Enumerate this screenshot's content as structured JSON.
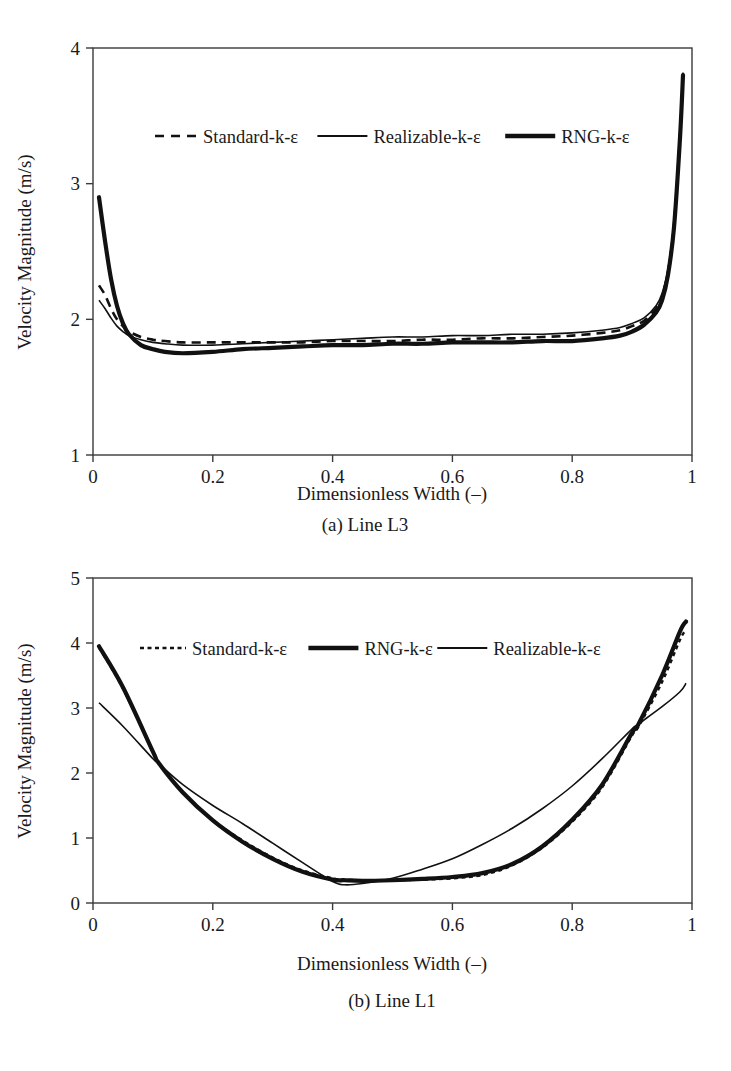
{
  "figure": {
    "panels": [
      {
        "id": "panel-a",
        "caption": "(a) Line L3",
        "xlabel": "Dimensionless Width (–)",
        "ylabel": "Velocity Magnitude (m/s)",
        "xticks": [
          "0",
          "0.2",
          "0.4",
          "0.6",
          "0.8",
          "1"
        ],
        "yticks": [
          "1",
          "2",
          "3",
          "4"
        ],
        "legend": [
          {
            "label": "Standard-k-ε",
            "style": "dashed"
          },
          {
            "label": "Realizable-k-ε",
            "style": "thin-solid"
          },
          {
            "label": "RNG-k-ε",
            "style": "thick-solid"
          }
        ]
      },
      {
        "id": "panel-b",
        "caption": "(b) Line L1",
        "xlabel": "Dimensionless Width (–)",
        "ylabel": "Velocity Magnitude (m/s)",
        "xticks": [
          "0",
          "0.2",
          "0.4",
          "0.6",
          "0.8",
          "1"
        ],
        "yticks": [
          "0",
          "1",
          "2",
          "3",
          "4",
          "5"
        ],
        "legend": [
          {
            "label": "Standard-k-ε",
            "style": "dotted"
          },
          {
            "label": "RNG-k-ε",
            "style": "thick-solid"
          },
          {
            "label": "Realizable-k-ε",
            "style": "thin-solid"
          }
        ]
      }
    ]
  },
  "chart_data": [
    {
      "type": "line",
      "title": "(a) Line L3",
      "xlabel": "Dimensionless Width (–)",
      "ylabel": "Velocity Magnitude (m/s)",
      "xlim": [
        0,
        1
      ],
      "ylim": [
        1,
        4
      ],
      "grid": false,
      "legend_position": "upper-center-inside",
      "x": [
        0.01,
        0.02,
        0.03,
        0.04,
        0.05,
        0.06,
        0.08,
        0.1,
        0.12,
        0.15,
        0.2,
        0.25,
        0.3,
        0.35,
        0.4,
        0.45,
        0.5,
        0.55,
        0.6,
        0.65,
        0.7,
        0.75,
        0.8,
        0.85,
        0.88,
        0.9,
        0.92,
        0.94,
        0.95,
        0.96,
        0.97,
        0.98,
        0.985
      ],
      "series": [
        {
          "name": "Standard-k-ε",
          "style": "dashed",
          "values": [
            2.25,
            2.18,
            2.08,
            2.0,
            1.95,
            1.91,
            1.87,
            1.85,
            1.84,
            1.83,
            1.83,
            1.83,
            1.83,
            1.83,
            1.84,
            1.84,
            1.84,
            1.85,
            1.85,
            1.86,
            1.86,
            1.87,
            1.88,
            1.9,
            1.92,
            1.95,
            1.99,
            2.08,
            2.17,
            2.35,
            2.7,
            3.35,
            3.8
          ]
        },
        {
          "name": "Realizable-k-ε",
          "style": "thin-solid",
          "values": [
            2.14,
            2.08,
            2.01,
            1.95,
            1.91,
            1.88,
            1.85,
            1.83,
            1.82,
            1.81,
            1.81,
            1.82,
            1.83,
            1.84,
            1.85,
            1.86,
            1.87,
            1.87,
            1.88,
            1.88,
            1.89,
            1.89,
            1.9,
            1.92,
            1.94,
            1.97,
            2.01,
            2.1,
            2.19,
            2.37,
            2.72,
            3.38,
            3.82
          ]
        },
        {
          "name": "RNG-k-ε",
          "style": "thick-solid",
          "values": [
            2.9,
            2.58,
            2.3,
            2.1,
            1.97,
            1.89,
            1.81,
            1.78,
            1.76,
            1.75,
            1.76,
            1.78,
            1.79,
            1.8,
            1.81,
            1.81,
            1.82,
            1.82,
            1.83,
            1.83,
            1.83,
            1.84,
            1.84,
            1.86,
            1.88,
            1.91,
            1.96,
            2.05,
            2.14,
            2.33,
            2.68,
            3.34,
            3.8
          ]
        }
      ]
    },
    {
      "type": "line",
      "title": "(b) Line L1",
      "xlabel": "Dimensionless Width (–)",
      "ylabel": "Velocity Magnitude (m/s)",
      "xlim": [
        0,
        1
      ],
      "ylim": [
        0,
        5
      ],
      "grid": false,
      "legend_position": "upper-center-inside",
      "x": [
        0.01,
        0.05,
        0.1,
        0.11,
        0.15,
        0.2,
        0.25,
        0.3,
        0.35,
        0.4,
        0.42,
        0.45,
        0.5,
        0.55,
        0.6,
        0.65,
        0.7,
        0.75,
        0.8,
        0.85,
        0.9,
        0.91,
        0.95,
        0.98,
        0.99
      ],
      "series": [
        {
          "name": "Standard-k-ε",
          "style": "dotted",
          "values": [
            3.93,
            3.3,
            2.32,
            2.14,
            1.7,
            1.28,
            0.96,
            0.7,
            0.5,
            0.38,
            0.36,
            0.35,
            0.35,
            0.36,
            0.38,
            0.43,
            0.58,
            0.85,
            1.25,
            1.78,
            2.58,
            2.7,
            3.4,
            4.05,
            4.2
          ]
        },
        {
          "name": "RNG-k-ε",
          "style": "thick-solid",
          "values": [
            3.95,
            3.32,
            2.33,
            2.15,
            1.7,
            1.27,
            0.94,
            0.68,
            0.48,
            0.36,
            0.35,
            0.34,
            0.35,
            0.37,
            0.4,
            0.46,
            0.6,
            0.87,
            1.28,
            1.82,
            2.62,
            2.74,
            3.5,
            4.18,
            4.33
          ]
        },
        {
          "name": "Realizable-k-ε",
          "style": "thin-solid",
          "values": [
            3.08,
            2.72,
            2.22,
            2.14,
            1.82,
            1.5,
            1.22,
            0.92,
            0.62,
            0.33,
            0.28,
            0.3,
            0.38,
            0.52,
            0.68,
            0.9,
            1.15,
            1.45,
            1.8,
            2.22,
            2.68,
            2.75,
            3.02,
            3.25,
            3.38
          ]
        }
      ]
    }
  ]
}
